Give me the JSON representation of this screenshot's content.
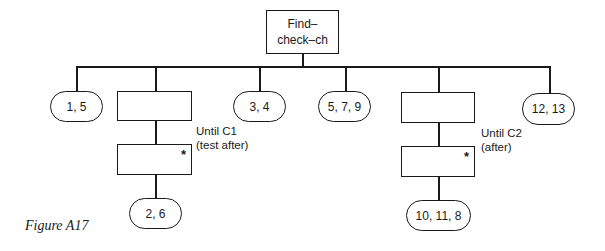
{
  "diagram": {
    "root": {
      "label": "Find–\ncheck–ch"
    },
    "children": [
      {
        "type": "leaf",
        "label": "1, 5"
      },
      {
        "type": "iteration",
        "condition": "Until C1\n(test after)",
        "iterated_marker": "*",
        "leaf": "2, 6"
      },
      {
        "type": "leaf",
        "label": "3, 4"
      },
      {
        "type": "leaf",
        "label": "5, 7, 9"
      },
      {
        "type": "iteration",
        "condition": "Until C2\n(after)",
        "iterated_marker": "*",
        "leaf": "10, 11, 8"
      },
      {
        "type": "leaf",
        "label": "12, 13"
      }
    ]
  },
  "caption": "Figure A17"
}
